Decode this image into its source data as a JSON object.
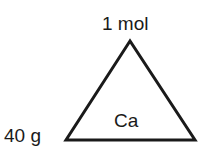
{
  "diagram": {
    "type": "formula-triangle",
    "top_label": "1 mol",
    "left_label": "40 g",
    "center_label": "Ca",
    "stroke_color": "#1a1a1a",
    "background": "#ffffff"
  }
}
